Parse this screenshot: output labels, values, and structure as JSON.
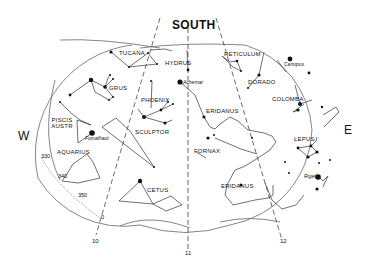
{
  "chart": {
    "title": "SOUTH",
    "directions": {
      "west": "W",
      "east": "E"
    },
    "hour_lines": [
      "10",
      "11",
      "12"
    ],
    "ecliptic_ticks": [
      "0",
      "330",
      "340",
      "350"
    ],
    "constellations": [
      "TUCANA",
      "HYDRUS",
      "RETICULUM",
      "GRUS",
      "DORADO",
      "PHOENIX",
      "COLOMBA",
      "ERIDANUS",
      "PISCIS AUSTR",
      "SCULPTOR",
      "LEPUS",
      "AQUARIUS",
      "FORNAX",
      "CETUS",
      "ERIDANUS"
    ],
    "stars": [
      "Achernar",
      "Canopus",
      "Fomalhaut",
      "Rigel"
    ],
    "colors": {
      "ink": "#111111",
      "outline": "#555555",
      "background": "#ffffff"
    }
  }
}
